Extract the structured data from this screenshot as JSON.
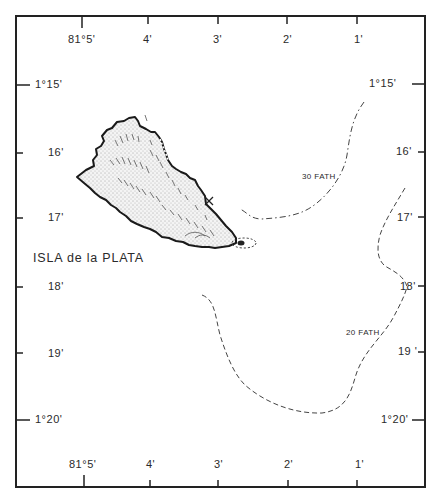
{
  "map": {
    "place_name": "ISLA de la PLATA",
    "top_lon_labels": [
      "81°5'",
      "4'",
      "3'",
      "2'",
      "1'"
    ],
    "bottom_lon_labels": [
      "81°5'",
      "4'",
      "3'",
      "2'",
      "1'"
    ],
    "left_lat_labels": [
      "1°15'",
      "16'",
      "17'",
      "18'",
      "19'",
      "1°20'"
    ],
    "right_lat_labels": [
      "1°15'",
      "16'",
      "17'",
      "18'",
      "19 '",
      "1°20'"
    ],
    "contours": [
      {
        "label": "30 FATH",
        "depth_fathoms": 30,
        "style": "dash-dot"
      },
      {
        "label": "20 FATH",
        "depth_fathoms": 20,
        "style": "dashed"
      }
    ],
    "marker": {
      "symbol": "×"
    },
    "colors": {
      "ink": "#222222",
      "land_fill": "#f2f2f2",
      "background": "#ffffff"
    }
  }
}
